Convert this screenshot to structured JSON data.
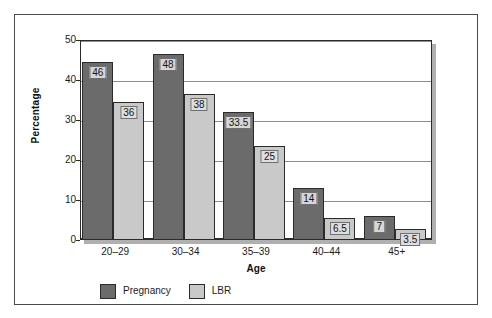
{
  "figure": {
    "frame_color": "#4a4a4a",
    "plot_background": "#ffffff"
  },
  "chart_data": {
    "type": "bar",
    "title": "",
    "xlabel": "Age",
    "ylabel": "Percentage",
    "categories": [
      "20–29",
      "30–34",
      "35–39",
      "40–44",
      "45+"
    ],
    "series": [
      {
        "name": "Pregnancy",
        "color": "#6b6b6b",
        "values": [
          46,
          48,
          33.5,
          14,
          7
        ],
        "labels": [
          "46",
          "48",
          "33.5",
          "14",
          "7"
        ]
      },
      {
        "name": "LBR",
        "color": "#c9c9c9",
        "values": [
          36,
          38,
          25,
          6.5,
          3.5
        ],
        "labels": [
          "36",
          "38",
          "25",
          "6.5",
          "3.5"
        ]
      }
    ],
    "ylim": [
      0,
      50
    ],
    "yticks": [
      0,
      10,
      20,
      30,
      40,
      50
    ],
    "ytick_labels": [
      "0",
      "10",
      "20",
      "30",
      "40",
      "50"
    ],
    "grid": true,
    "grid_axis": "y",
    "legend_position": "bottom-left",
    "legend": [
      "Pregnancy",
      "LBR"
    ]
  }
}
